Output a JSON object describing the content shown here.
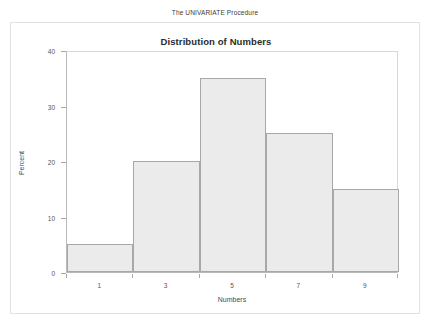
{
  "page": {
    "procedure_title": "The UNIVARIATE Procedure"
  },
  "chart_data": {
    "type": "bar",
    "title": "Distribution of Numbers",
    "xlabel": "Numbers",
    "ylabel": "Percent",
    "categories": [
      "1",
      "3",
      "5",
      "7",
      "9"
    ],
    "values": [
      5,
      20,
      35,
      25,
      15
    ],
    "bin_centers": [
      1,
      3,
      5,
      7,
      9
    ],
    "bin_edges": [
      0,
      2,
      4,
      6,
      8,
      10
    ],
    "xtick_labels": [
      "1",
      "3",
      "5",
      "7",
      "9"
    ],
    "ytick_labels": [
      "0",
      "10",
      "20",
      "30",
      "40"
    ],
    "ytick_values": [
      0,
      10,
      20,
      30,
      40
    ],
    "ylim": [
      0,
      40
    ],
    "xlim": [
      0,
      10
    ],
    "grid": false,
    "legend": null,
    "bar_fill_color": "#ebebeb",
    "bar_border_color": "#a8a8a8"
  }
}
